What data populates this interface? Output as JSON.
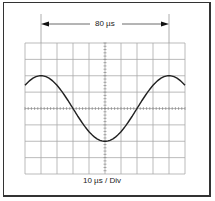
{
  "diagram": {
    "period_label": "80 µs",
    "timebase_label": "10 µs / Div",
    "grid": {
      "columns": 10,
      "rows": 8,
      "color": "#aaaaaa"
    },
    "waveform": {
      "type": "cosine",
      "period_divisions": 8,
      "amplitude_divisions": 2,
      "color": "#222222"
    }
  }
}
